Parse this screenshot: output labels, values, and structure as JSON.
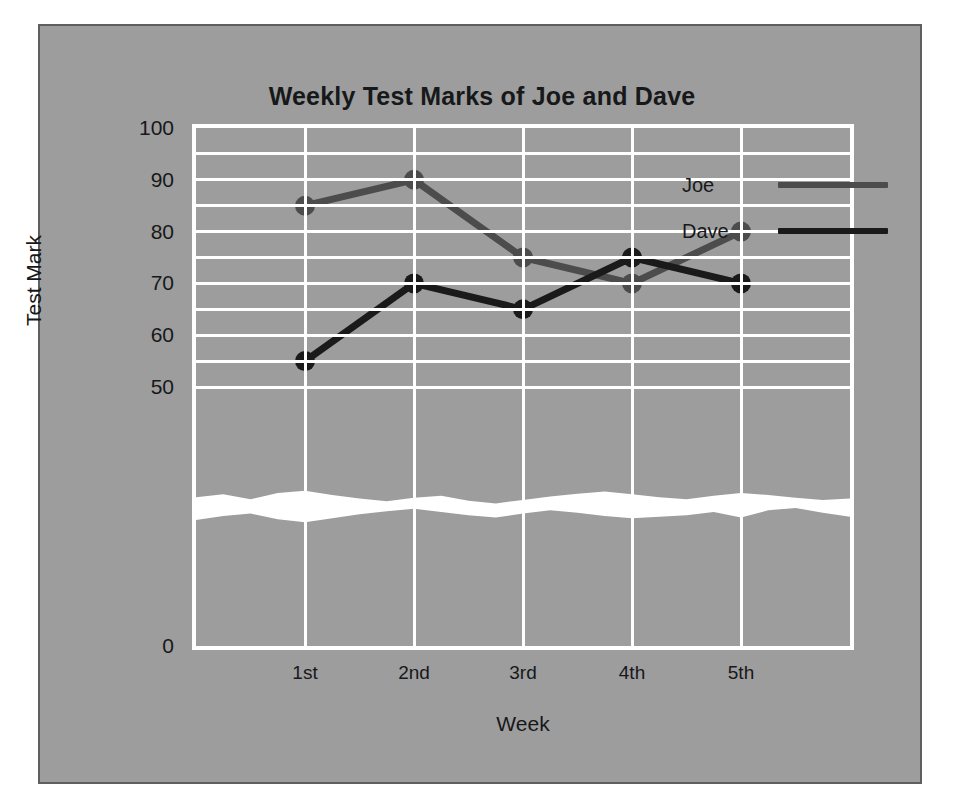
{
  "chart_data": {
    "type": "line",
    "title": "Weekly Test Marks of Joe and Dave",
    "xlabel": "Week",
    "ylabel": "Test Mark",
    "categories": [
      "1st",
      "2nd",
      "3rd",
      "4th",
      "5th"
    ],
    "series": [
      {
        "name": "Joe",
        "color": "#4c4c4c",
        "values": [
          85,
          90,
          75,
          70,
          80
        ]
      },
      {
        "name": "Dave",
        "color": "#1a1a1a",
        "values": [
          55,
          70,
          65,
          75,
          70
        ]
      }
    ],
    "ylim": [
      0,
      100
    ],
    "y_major_ticks": [
      0,
      50,
      60,
      70,
      80,
      90,
      100
    ],
    "y_minor_step": 5,
    "y_axis_break": {
      "present": true,
      "between": [
        0,
        50
      ],
      "style": "wavy-white-band"
    },
    "grid": true,
    "legend_position": "top-right-inside",
    "background_color": "#9d9d9d",
    "gridline_color": "#ffffff",
    "text_color": "#17181a"
  }
}
